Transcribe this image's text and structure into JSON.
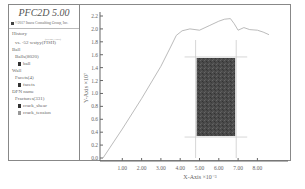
{
  "app": {
    "title": "PFC2D 5.00",
    "company": "©2017 Itasca Consulting Group, Inc."
  },
  "sidebar": {
    "history_label": "History",
    "history_item": "vs. -52 wstyy(FISH)",
    "history_superscript": "(PFC2D, FISH)",
    "ball_label": "Ball",
    "ball_group": "Balls(8020)",
    "ball_item": "ball",
    "wall_label": "Wall",
    "wall_group": "Facets(4)",
    "wall_item": "facets",
    "dfn_label": "DFN name",
    "dfn_group": "Fractures(331)",
    "dfn_items": [
      "crack_shear",
      "crack_tension"
    ]
  },
  "chart_data": {
    "type": "line",
    "title": "",
    "xlabel": "X-Axis ×10⁻³",
    "ylabel": "Y-Axis ×10⁷",
    "xlim": [
      0,
      9
    ],
    "ylim": [
      0,
      2.2
    ],
    "x_ticks": [
      "1.00",
      "2.00",
      "3.00",
      "4.00",
      "5.00",
      "6.00",
      "7.00",
      "8.00"
    ],
    "y_ticks": [
      "0.0",
      "0.2",
      "0.4",
      "0.6",
      "0.8",
      "1.0",
      "1.2",
      "1.4",
      "1.6",
      "1.8",
      "2.0",
      "2.2"
    ],
    "grid": false,
    "series": [
      {
        "name": "stress-strain",
        "x": [
          0,
          1.0,
          2.0,
          3.0,
          3.5,
          3.8,
          4.1,
          4.5,
          5.0,
          5.5,
          6.0,
          6.3,
          6.6,
          6.8,
          7.0,
          7.3,
          7.6,
          8.0,
          8.3,
          8.6
        ],
        "y": [
          0,
          0.45,
          0.92,
          1.42,
          1.72,
          1.9,
          1.97,
          2.0,
          1.98,
          2.05,
          2.12,
          2.15,
          2.16,
          2.08,
          1.98,
          2.02,
          1.99,
          1.98,
          1.95,
          1.91
        ]
      }
    ],
    "inset": {
      "description": "dark specimen rectangle with crosshair guide lines",
      "x_range": [
        4.85,
        6.85
      ],
      "y_range": [
        0.34,
        1.55
      ]
    }
  }
}
